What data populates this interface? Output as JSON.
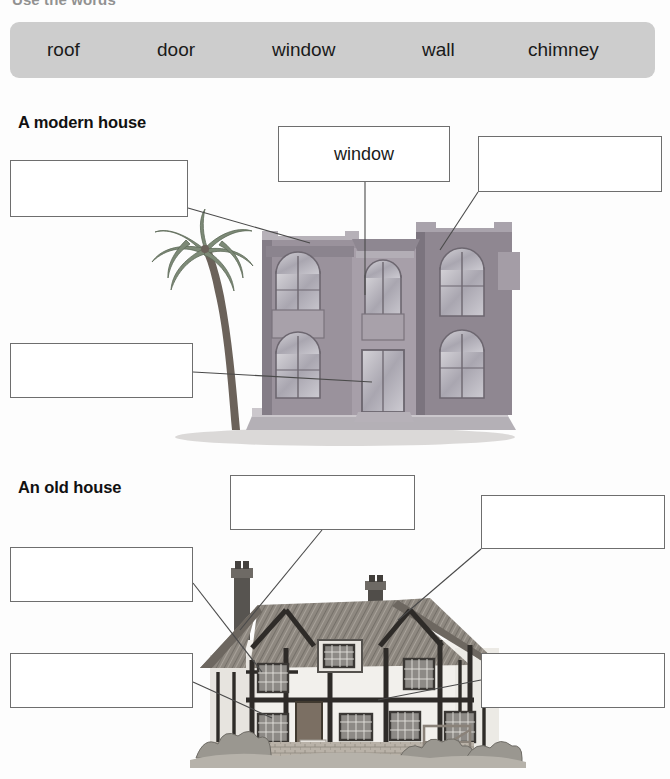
{
  "instruction": "Use the words",
  "wordbank": {
    "words": [
      "roof",
      "door",
      "window",
      "wall",
      "chimney"
    ],
    "background_color": "#cdcdcd"
  },
  "sections": [
    {
      "heading": "A modern house",
      "boxes": [
        {
          "name": "roof-label-box",
          "answer": "",
          "target": "roof"
        },
        {
          "name": "window-label-box",
          "answer": "window",
          "target": "window"
        },
        {
          "name": "wall-label-box",
          "answer": "",
          "target": "wall"
        },
        {
          "name": "door-label-box",
          "answer": "",
          "target": "door"
        }
      ]
    },
    {
      "heading": "An old house",
      "boxes": [
        {
          "name": "chimney-label-box",
          "answer": "",
          "target": "chimney"
        },
        {
          "name": "roof-label-box",
          "answer": "",
          "target": "roof"
        },
        {
          "name": "wall-left-label-box",
          "answer": "",
          "target": "wall"
        },
        {
          "name": "window-label-box",
          "answer": "",
          "target": "window"
        },
        {
          "name": "wall-right-label-box",
          "answer": "",
          "target": "wall"
        }
      ]
    }
  ],
  "illustrations": {
    "modern_house": "two-storey grey house with arched windows, balconies and a palm tree",
    "old_house": "timber-framed Tudor cottage with thatched roof and two chimneys"
  }
}
